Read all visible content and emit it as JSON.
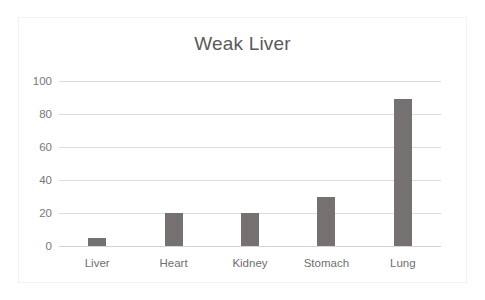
{
  "chart_data": {
    "type": "bar",
    "title": "Weak Liver",
    "xlabel": "",
    "ylabel": "",
    "categories": [
      "Liver",
      "Heart",
      "Kidney",
      "Stomach",
      "Lung"
    ],
    "values": [
      5,
      20,
      20,
      30,
      89
    ],
    "ylim": [
      0,
      100
    ],
    "yticks": [
      0,
      20,
      40,
      60,
      80,
      100
    ],
    "ytick_labels": [
      "0",
      "20",
      "40",
      "60",
      "80",
      "100"
    ],
    "grid": true,
    "grid_axis": "y",
    "legend": false,
    "legend_position": "none",
    "series": [
      {
        "name": "Weak Liver",
        "values": [
          5,
          20,
          20,
          30,
          89
        ]
      }
    ]
  },
  "style": {
    "bar_color": "#767171",
    "grid_color": "#dcdcdc",
    "title_color": "#5a5a5a",
    "tick_label_color": "#777777",
    "plot_background": "#ffffff",
    "frame_border_color": "#f2f2f2"
  }
}
